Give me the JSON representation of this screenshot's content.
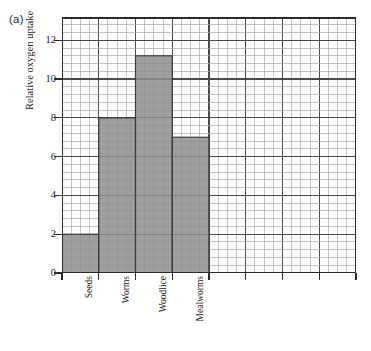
{
  "figure": {
    "panel_label": "(a)"
  },
  "chart_data": {
    "type": "bar",
    "title": "",
    "xlabel": "",
    "ylabel": "Relative oxygen uptake",
    "categories": [
      "Seeds",
      "Worms",
      "Woodlice",
      "Mealworms"
    ],
    "values": [
      2,
      8,
      11.2,
      7
    ],
    "ylim": [
      0,
      13.2
    ],
    "xlim": [
      0,
      8
    ],
    "y_ticks": [
      0,
      2,
      4,
      6,
      8,
      10,
      12
    ],
    "y_tick_labels": [
      "0",
      "2",
      "4",
      "6",
      "8",
      "10",
      "12"
    ],
    "x_tick_count": 8,
    "grid": true,
    "grid_minor_step": 0.4,
    "grid_major_step": 2,
    "legend": "none",
    "bar_fill_color": "#8d8d8d",
    "bar_edge_color": "#3a3a3a",
    "grid_minor_color": "#a9a9a9",
    "grid_major_color": "#4a4a4a",
    "axis_color": "#2b2b2b",
    "background_color": "#ffffff"
  }
}
